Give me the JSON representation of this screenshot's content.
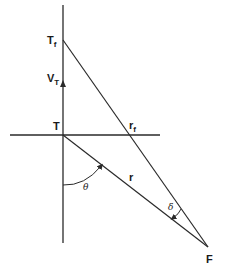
{
  "diagram": {
    "type": "geometry",
    "stroke_color": "#2a2a2a",
    "background": "#ffffff",
    "points": {
      "T": {
        "label": "T",
        "x": 63,
        "y": 135
      },
      "Tf": {
        "label": "T",
        "subscript": "f",
        "x": 63,
        "y": 40
      },
      "rf": {
        "label": "r",
        "subscript": "f",
        "x": 130,
        "y": 135
      },
      "F": {
        "label": "F",
        "x": 208,
        "y": 247
      }
    },
    "vector": {
      "label": "V",
      "subscript": "T",
      "from_y": 135,
      "to_y": 82
    },
    "segments": [
      {
        "name": "vertical-axis",
        "x1": 63,
        "y1": 5,
        "x2": 63,
        "y2": 243
      },
      {
        "name": "horizontal-axis",
        "x1": 10,
        "y1": 135,
        "x2": 160,
        "y2": 135
      },
      {
        "name": "line-Tf-F",
        "x1": 63,
        "y1": 40,
        "x2": 208,
        "y2": 247
      },
      {
        "name": "line-T-F",
        "x1": 63,
        "y1": 135,
        "x2": 208,
        "y2": 247
      }
    ],
    "angles": [
      {
        "name": "theta",
        "label": "θ",
        "vertex": "T",
        "between": [
          "downward vertical",
          "r"
        ]
      },
      {
        "name": "delta",
        "label": "δ",
        "vertex": "F",
        "between": [
          "r",
          "line-Tf-F"
        ]
      }
    ],
    "labels": {
      "T": "T",
      "Tf_main": "T",
      "Tf_sub": "f",
      "VT_main": "V",
      "VT_sub": "T",
      "rf_main": "r",
      "rf_sub": "f",
      "r": "r",
      "theta": "θ",
      "delta": "δ",
      "F": "F"
    }
  }
}
